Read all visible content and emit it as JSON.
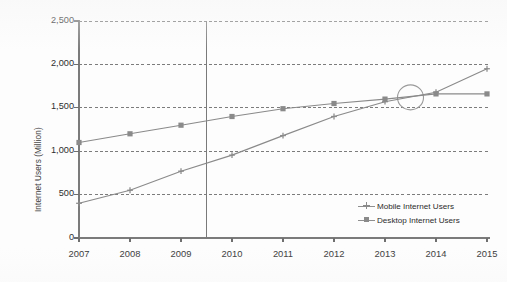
{
  "chart_data": {
    "type": "line",
    "title": "",
    "xlabel": "",
    "ylabel": "Internet Users (Million)",
    "categories": [
      "2007",
      "2008",
      "2009",
      "2010",
      "2011",
      "2012",
      "2013",
      "2014",
      "2015"
    ],
    "x": [
      2007,
      2008,
      2009,
      2010,
      2011,
      2012,
      2013,
      2014,
      2015
    ],
    "series": [
      {
        "name": "Mobile Internet Users",
        "marker": "cross",
        "color": "#8a8a8a",
        "values": [
          400,
          550,
          770,
          955,
          1180,
          1400,
          1570,
          1680,
          1950
        ]
      },
      {
        "name": "Desktop Internet Users",
        "marker": "square",
        "color": "#8a8a8a",
        "values": [
          1100,
          1200,
          1300,
          1400,
          1490,
          1550,
          1600,
          1660,
          1660
        ]
      }
    ],
    "ylim": [
      0,
      2500
    ],
    "ytick_values": [
      0,
      500,
      1000,
      1500,
      2000,
      2500
    ],
    "ytick_labels": [
      "0",
      "500",
      "1,000",
      "1,500",
      "2,000",
      "2,500"
    ],
    "grid": "horizontal-dashed",
    "legend_position": "inside-bottom-right",
    "annotations": [
      {
        "kind": "vertical-line",
        "name": "forecast-divider",
        "x_value": 2009.5,
        "color": "#7a7a7a"
      },
      {
        "kind": "ellipse-highlight",
        "name": "crossover-circle",
        "x_value": 2013.5,
        "y_value": 1620,
        "color": "#9a9a9a"
      }
    ]
  },
  "axes": {
    "y_axis_title": "Internet Users (Million)",
    "y_ticks": [
      "2,500",
      "2,000",
      "1,500",
      "1,000",
      "500",
      "0"
    ],
    "x_ticks": [
      "2007",
      "2008",
      "2009",
      "2010",
      "2011",
      "2012",
      "2013",
      "2014",
      "2015"
    ]
  },
  "legend": {
    "items": [
      {
        "label": "Mobile Internet Users",
        "marker": "cross"
      },
      {
        "label": "Desktop Internet Users",
        "marker": "square"
      }
    ]
  }
}
